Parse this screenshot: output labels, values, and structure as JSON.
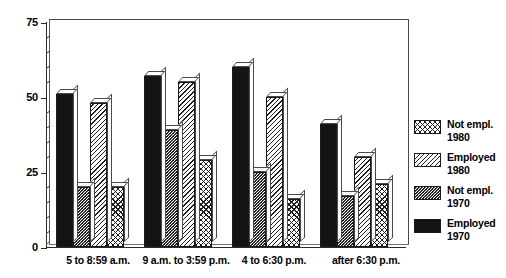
{
  "chart_data": {
    "type": "bar",
    "title": "",
    "subtitle": "",
    "xlabel": "",
    "ylabel": "",
    "ylim": [
      0,
      75
    ],
    "yticks": [
      0,
      25,
      50,
      75
    ],
    "ytick_labels": [
      "0",
      "25",
      "50",
      "75"
    ],
    "minor_ticks_per_interval": 4,
    "grid": false,
    "legend_position": "right",
    "style": "3d-grouped-bars",
    "categories": [
      "5 to 8:59 a.m.",
      "9 a.m. to 3:59 p.m.",
      "4 to 6:30 p.m.",
      "after 6:30 p.m."
    ],
    "series": [
      {
        "name": "Employed 1970",
        "legend_label_line1": "Employed",
        "legend_label_line2": "1970",
        "pattern": "solid-black",
        "color": "#141414",
        "values": [
          51,
          57,
          60,
          41
        ]
      },
      {
        "name": "Not empl. 1970",
        "legend_label_line1": "Not empl.",
        "legend_label_line2": "1970",
        "pattern": "fine-dots",
        "color": "#1a1a1a",
        "values": [
          20,
          39,
          25,
          17
        ]
      },
      {
        "name": "Employed 1980",
        "legend_label_line1": "Employed",
        "legend_label_line2": "1980",
        "pattern": "diagonal-hatch",
        "color": "#1f1f1f",
        "values": [
          48,
          55,
          50,
          30
        ]
      },
      {
        "name": "Not empl. 1980",
        "legend_label_line1": "Not empl.",
        "legend_label_line2": "1980",
        "pattern": "cross-hatch",
        "color": "#1f1f1f",
        "values": [
          20,
          29,
          16,
          21
        ]
      }
    ]
  },
  "axis": {
    "y_labels": [
      "75",
      "50",
      "25",
      "0"
    ]
  },
  "legend": {
    "entries": [
      {
        "line1": "Not empl.",
        "line2": "1980",
        "pattern": "cross-hatch"
      },
      {
        "line1": "Employed",
        "line2": "1980",
        "pattern": "diagonal-hatch"
      },
      {
        "line1": "Not empl.",
        "line2": "1970",
        "pattern": "fine-dots"
      },
      {
        "line1": "Employed",
        "line2": "1970",
        "pattern": "solid-black"
      }
    ]
  }
}
